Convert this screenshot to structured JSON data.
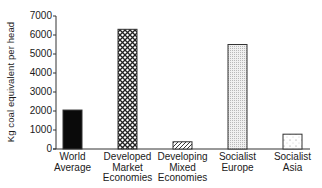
{
  "chart_data": {
    "type": "bar",
    "title": "",
    "xlabel": "",
    "ylabel": "Kg coal equivalent per head",
    "ylim": [
      0,
      7000
    ],
    "yticks": [
      0,
      1000,
      2000,
      3000,
      4000,
      5000,
      6000,
      7000
    ],
    "grid": false,
    "legend": "none",
    "categories": [
      "World Average",
      "Developed Market Economies",
      "Developing Mixed Economies",
      "Socialist Europe",
      "Socialist Asia"
    ],
    "category_lines": [
      [
        "World",
        "Average"
      ],
      [
        "Developed",
        "Market",
        "Economies"
      ],
      [
        "Developing",
        "Mixed",
        "Economies"
      ],
      [
        "Socialist",
        "Europe"
      ],
      [
        "Socialist",
        "Asia"
      ]
    ],
    "values": [
      2050,
      6300,
      380,
      5500,
      780
    ],
    "fill_patterns": [
      "solid-black",
      "crosshatch",
      "diagonal-hatch",
      "fine-stipple",
      "sparse-dots"
    ]
  },
  "axis": {
    "ylabel": "Kg coal equivalent per head",
    "ticks": [
      "0",
      "1000",
      "2000",
      "3000",
      "4000",
      "5000",
      "6000",
      "7000"
    ]
  }
}
